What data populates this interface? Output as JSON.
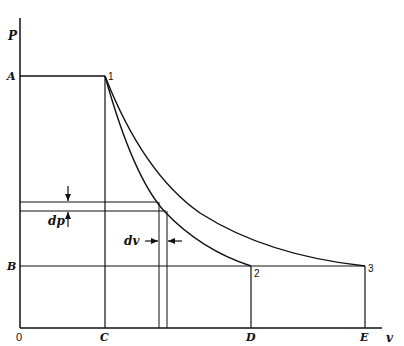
{
  "diagram": {
    "type": "p-v diagram",
    "axes": {
      "y_label": "P",
      "x_label": "v",
      "origin_label": "0"
    },
    "pressure_levels": {
      "high": "A",
      "low": "B"
    },
    "volume_marks": [
      "C",
      "D",
      "E"
    ],
    "states": {
      "s1": "1",
      "s2": "2",
      "s3": "3"
    },
    "curves": [
      {
        "name": "steeper",
        "from": "1",
        "to": "2"
      },
      {
        "name": "shallower",
        "from": "1",
        "to": "3"
      }
    ],
    "differentials": {
      "dp": "dp",
      "dv": "dv"
    },
    "color": "#111111"
  }
}
